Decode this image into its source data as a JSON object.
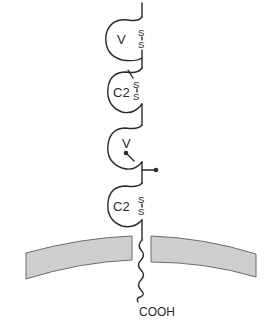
{
  "diagram": {
    "type": "protein-domain-schematic",
    "colors": {
      "line": "#2a2a2a",
      "membrane_fill": "#cfcfcf",
      "membrane_edge": "#6a6a6a",
      "background": "#ffffff"
    },
    "domains": [
      {
        "label": "V",
        "has_disulfide": true,
        "disulfide_s1": "S",
        "disulfide_s2": "S"
      },
      {
        "label": "C2",
        "has_disulfide": true,
        "disulfide_s1": "S",
        "disulfide_s2": "S"
      },
      {
        "label": "V",
        "has_disulfide": false,
        "glycosylation_sites": 2
      },
      {
        "label": "C2",
        "has_disulfide": true,
        "disulfide_s1": "S",
        "disulfide_s2": "S"
      }
    ],
    "membrane": {
      "label": "",
      "segments": 2
    },
    "transmembrane": {
      "style": "wavy"
    },
    "terminus": {
      "label": "COOH"
    }
  }
}
